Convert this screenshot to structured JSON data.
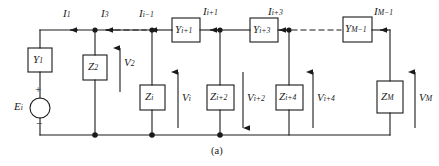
{
  "figure": {
    "caption": "(a)",
    "type": "ladder-network-circuit-diagram"
  },
  "source": {
    "label_main": "E",
    "label_sub": "i",
    "plus_sign": "+",
    "minus_sign": "−"
  },
  "series_elements": [
    {
      "name": "element-y1",
      "main": "Y",
      "sub": "1"
    },
    {
      "name": "element-yi1",
      "main": "Y",
      "sub": "i+1"
    },
    {
      "name": "element-yi3",
      "main": "Y",
      "sub": "i+3"
    },
    {
      "name": "element-ym1",
      "main": "Y",
      "sub": "M−1"
    }
  ],
  "shunt_elements": [
    {
      "name": "element-z2",
      "main": "Z",
      "sub": "2"
    },
    {
      "name": "element-zi",
      "main": "Z",
      "sub": "i"
    },
    {
      "name": "element-zi2",
      "main": "Z",
      "sub": "i+2"
    },
    {
      "name": "element-zi4",
      "main": "Z",
      "sub": "i+4"
    },
    {
      "name": "element-zm",
      "main": "Z",
      "sub": "M"
    }
  ],
  "currents": [
    {
      "name": "current-i1",
      "main": "I",
      "sub": "1",
      "direction": "left"
    },
    {
      "name": "current-i3",
      "main": "I",
      "sub": "3",
      "direction": "left"
    },
    {
      "name": "current-ii1m",
      "main": "I",
      "sub": "i−1",
      "direction": "left"
    },
    {
      "name": "current-ii1p",
      "main": "I",
      "sub": "i+1",
      "direction": "left"
    },
    {
      "name": "current-ii3",
      "main": "I",
      "sub": "i+3",
      "direction": "left"
    },
    {
      "name": "current-im1",
      "main": "I",
      "sub": "M−1",
      "direction": "left"
    }
  ],
  "voltages": [
    {
      "name": "voltage-v2",
      "main": "V",
      "sub": "2",
      "direction": "up"
    },
    {
      "name": "voltage-vi",
      "main": "V",
      "sub": "i",
      "direction": "up"
    },
    {
      "name": "voltage-vi2",
      "main": "V",
      "sub": "i+2",
      "direction": "down"
    },
    {
      "name": "voltage-vi4",
      "main": "V",
      "sub": "i+4",
      "direction": "up"
    },
    {
      "name": "voltage-vm",
      "main": "V",
      "sub": "M",
      "direction": "up"
    }
  ],
  "colors": {
    "wire": "#1a1a1a",
    "text": "#1a1a1a",
    "background": "#ffffff"
  }
}
